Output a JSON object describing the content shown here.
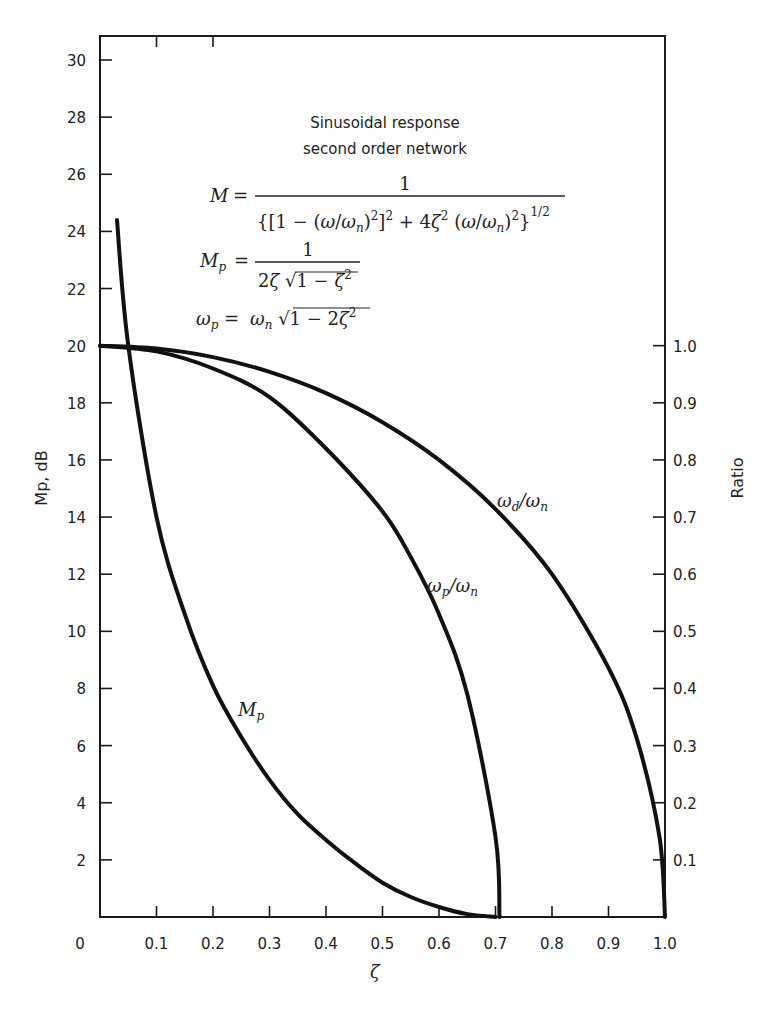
{
  "chart_data": {
    "type": "line",
    "title": "Sinusoidal response second order network",
    "title_lines": [
      "Sinusoidal response",
      "second order network"
    ],
    "equations": {
      "M": "M = 1 / {[1 - (ω/ωn)^2]^2 + 4ζ^2 (ω/ωn)^2}^(1/2)",
      "Mp": "Mp = 1 / (2ζ √(1 - ζ^2))",
      "wp": "ωp = ωn √(1 - 2ζ^2)"
    },
    "xlabel": "ζ",
    "ylabel_left": "Mp, dB",
    "ylabel_right": "Ratio",
    "xlim": [
      0,
      1.0
    ],
    "ylim_left": [
      0,
      30
    ],
    "ylim_right": [
      0,
      1.0
    ],
    "x_ticks": [
      "0",
      "0.1",
      "0.2",
      "0.3",
      "0.4",
      "0.5",
      "0.6",
      "0.7",
      "0.8",
      "0.9",
      "1.0"
    ],
    "y_left_ticks": [
      "2",
      "4",
      "6",
      "8",
      "10",
      "12",
      "14",
      "16",
      "18",
      "20",
      "22",
      "24",
      "26",
      "28",
      "30"
    ],
    "y_right_ticks": [
      "0.1",
      "0.2",
      "0.3",
      "0.4",
      "0.5",
      "0.6",
      "0.7",
      "0.8",
      "0.9",
      "1.0"
    ],
    "grid": false,
    "series": [
      {
        "name": "Mp",
        "label": "Mp",
        "axis": "left",
        "unit": "dB",
        "x": [
          0.03,
          0.05,
          0.1,
          0.15,
          0.2,
          0.25,
          0.3,
          0.35,
          0.4,
          0.45,
          0.5,
          0.55,
          0.6,
          0.65,
          0.7
        ],
        "values": [
          24.4,
          20.0,
          14.0,
          10.6,
          8.1,
          6.3,
          4.8,
          3.6,
          2.7,
          1.9,
          1.2,
          0.7,
          0.35,
          0.1,
          0.0
        ]
      },
      {
        "name": "ωp/ωn",
        "label": "ωp/ωn",
        "axis": "right",
        "x": [
          0,
          0.1,
          0.2,
          0.3,
          0.4,
          0.5,
          0.55,
          0.6,
          0.65,
          0.7,
          0.707
        ],
        "values": [
          1.0,
          0.99,
          0.96,
          0.91,
          0.82,
          0.71,
          0.63,
          0.53,
          0.39,
          0.14,
          0.0
        ]
      },
      {
        "name": "ωd/ωn",
        "label": "ωd/ωn",
        "axis": "right",
        "x": [
          0,
          0.1,
          0.2,
          0.3,
          0.4,
          0.5,
          0.6,
          0.7,
          0.8,
          0.9,
          0.95,
          0.99,
          1.0
        ],
        "values": [
          1.0,
          0.995,
          0.98,
          0.954,
          0.917,
          0.866,
          0.8,
          0.714,
          0.6,
          0.436,
          0.312,
          0.141,
          0.0
        ]
      }
    ]
  }
}
